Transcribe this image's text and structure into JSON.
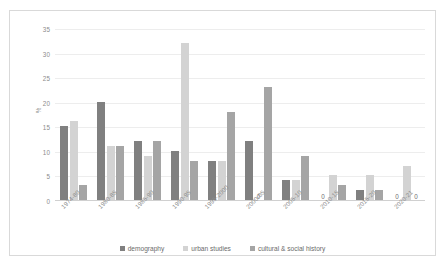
{
  "chart_data": {
    "type": "bar",
    "title": "",
    "xlabel": "",
    "ylabel": "%",
    "ylim": [
      0,
      35
    ],
    "yticks": [
      0,
      5,
      10,
      15,
      20,
      25,
      30,
      35
    ],
    "grid": true,
    "legend_position": "bottom",
    "categories": [
      "1974-80",
      "1980-85",
      "1985-90",
      "1990-95",
      "1995-2000",
      "2000-05",
      "2005-10",
      "2010-15",
      "2015-20",
      "2020-21"
    ],
    "series": [
      {
        "name": "demography",
        "color": "#808080",
        "values": [
          15,
          20,
          12,
          10,
          8,
          12,
          4,
          0,
          2,
          0
        ]
      },
      {
        "name": "urban studies",
        "color": "#d3d3d3",
        "values": [
          16,
          11,
          9,
          32,
          8,
          0,
          4,
          5,
          5,
          7
        ]
      },
      {
        "name": "cultural & social history",
        "color": "#a5a5a5",
        "values": [
          3,
          11,
          12,
          8,
          18,
          23,
          9,
          3,
          2,
          0
        ]
      }
    ],
    "zero_labels": [
      "0"
    ]
  }
}
